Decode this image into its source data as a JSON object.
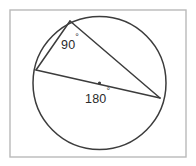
{
  "figure": {
    "frame": {
      "x": 10,
      "y": 10,
      "width": 176,
      "height": 147,
      "stroke_color": "#b9b9b9"
    },
    "circle": {
      "center_x": 99.5,
      "center_y": 83,
      "radius": 66.5,
      "stroke_color": "#3c3c3c"
    },
    "center_point": {
      "x": 99.5,
      "y": 83,
      "radius": 1.6,
      "visible": true
    },
    "vertices": [
      {
        "name": "top-vertex",
        "x": 70,
        "y": 21
      },
      {
        "name": "left-vertex",
        "x": 36,
        "y": 70
      },
      {
        "name": "right-vertex",
        "x": 160,
        "y": 98
      }
    ],
    "segments": [
      {
        "name": "chord-top-to-left",
        "x1": 70,
        "y1": 21,
        "x2": 36,
        "y2": 70
      },
      {
        "name": "chord-top-to-right",
        "x1": 70,
        "y1": 21,
        "x2": 160,
        "y2": 98
      },
      {
        "name": "diameter-left-to-right",
        "x1": 36,
        "y1": 70,
        "x2": 160,
        "y2": 98
      }
    ],
    "labels": [
      {
        "name": "inscribed-angle-label",
        "value": "90",
        "degree_symbol": "°",
        "x": 61,
        "y": 49,
        "anchor": "start"
      },
      {
        "name": "central-angle-label",
        "value": "180",
        "degree_symbol": "°",
        "x": 85,
        "y": 103,
        "anchor": "start"
      }
    ],
    "background_color": "#ffffff",
    "line_color": "#3c3c3c",
    "text_color": "#2b2b2b"
  }
}
